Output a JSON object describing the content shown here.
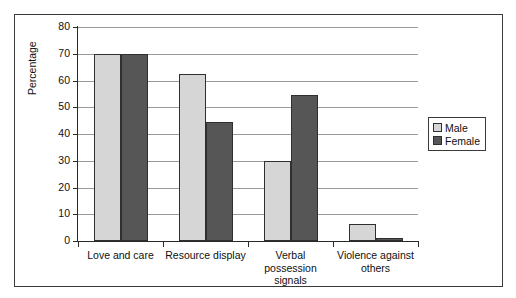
{
  "chart_data": {
    "type": "bar",
    "title": "",
    "xlabel": "",
    "ylabel": "Percentage",
    "ylim": [
      0,
      80
    ],
    "ytick_step": 10,
    "yticks": [
      0,
      10,
      20,
      30,
      40,
      50,
      60,
      70,
      80
    ],
    "grid": true,
    "grid_axis": "y",
    "legend_position": "right",
    "categories": [
      "Love and care",
      "Resource display",
      "Verbal possession signals",
      "Violence against others"
    ],
    "series": [
      {
        "name": "Male",
        "color": "#d6d6d6",
        "values": [
          70,
          62.5,
          30,
          6.5
        ]
      },
      {
        "name": "Female",
        "color": "#565656",
        "values": [
          70,
          44.5,
          54.5,
          1
        ]
      }
    ]
  },
  "legend": {
    "items": [
      {
        "label": "Male"
      },
      {
        "label": "Female"
      }
    ]
  },
  "axis": {
    "y_label": "Percentage"
  }
}
